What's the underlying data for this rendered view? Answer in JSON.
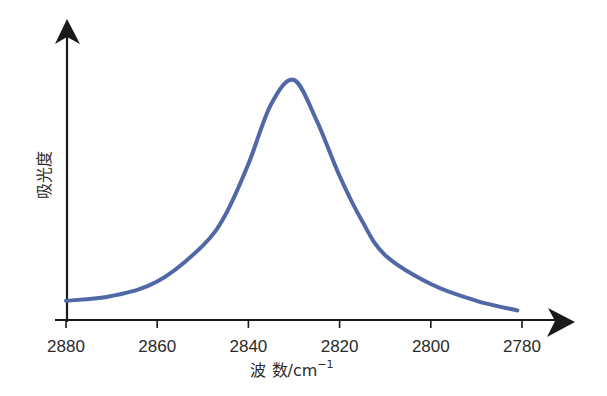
{
  "chart_data": {
    "type": "line",
    "title": "",
    "xlabel": "波 数/cm⁻¹",
    "xlabel_main": "波 数/cm",
    "xlabel_sup": "−1",
    "ylabel": "吸光度",
    "x_reversed": true,
    "xlim": [
      2880,
      2780
    ],
    "ylim": [
      0,
      1.2
    ],
    "xticks": [
      2880,
      2860,
      2840,
      2820,
      2800,
      2780
    ],
    "yticks": [],
    "grid": false,
    "legend": null,
    "line_color": "#5068a6",
    "axis_color": "#1a1a1a",
    "series": [
      {
        "name": "absorbance",
        "x": [
          2880,
          2870,
          2860,
          2850,
          2845,
          2840,
          2835,
          2830,
          2825,
          2820,
          2815,
          2810,
          2800,
          2790,
          2781
        ],
        "values": [
          0.08,
          0.1,
          0.16,
          0.31,
          0.44,
          0.65,
          0.9,
          1.0,
          0.83,
          0.6,
          0.41,
          0.27,
          0.15,
          0.08,
          0.04
        ]
      }
    ],
    "annotations": []
  }
}
